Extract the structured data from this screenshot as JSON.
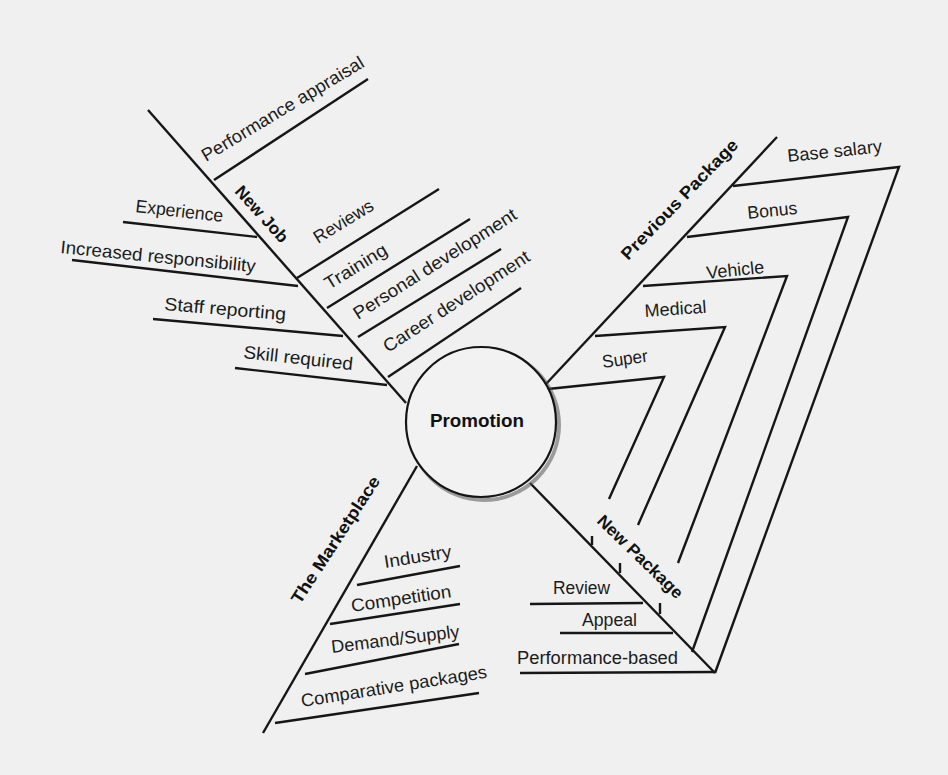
{
  "diagram": {
    "title": "Promotion",
    "center": {
      "label": "Promotion"
    },
    "branches": [
      {
        "label": "New Job",
        "items": [
          "Performance appraisal",
          "Experience",
          "Increased responsibility",
          "Staff reporting",
          "Skill required",
          "Reviews",
          "Training",
          "Personal development",
          "Career development"
        ]
      },
      {
        "label": "Previous Package",
        "items": [
          "Base salary",
          "Bonus",
          "Vehicle",
          "Medical",
          "Super"
        ]
      },
      {
        "label": "New Package",
        "items": [
          "Review",
          "Appeal",
          "Performance-based"
        ]
      },
      {
        "label": "The Marketplace",
        "items": [
          "Industry",
          "Competition",
          "Demand/Supply",
          "Comparative packages"
        ]
      }
    ]
  },
  "colors": {
    "background": "#f0f0f0",
    "line": "#161616",
    "text": "#1b1b1b"
  }
}
